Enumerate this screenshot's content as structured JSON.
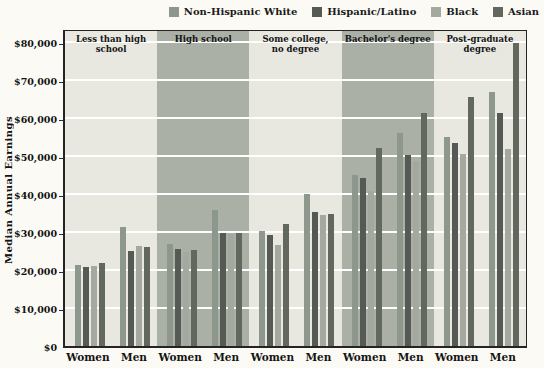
{
  "legend": [
    {
      "label": "Non-Hispanic White",
      "color": "#8e978b",
      "hatched": false
    },
    {
      "label": "Hispanic/Latino",
      "color": "#565a54",
      "hatched": true
    },
    {
      "label": "Black",
      "color": "#a4a89f",
      "hatched": false
    },
    {
      "label": "Asian",
      "color": "#63685f",
      "hatched": false
    }
  ],
  "y_axis": {
    "title": "Median Annual Earnings",
    "ticks": [
      "$0",
      "$10,000",
      "$20,000",
      "$30,000",
      "$40,000",
      "$50,000",
      "$60,000",
      "$70,000",
      "$80,000"
    ]
  },
  "colors": {
    "background": "#fbfaf5",
    "band_light": "#e8e8e1",
    "band_dark": "#aab0a5",
    "gridline": "#ffffff",
    "border": "#242424"
  },
  "chart_data": {
    "type": "bar",
    "title": "",
    "xlabel": "",
    "ylabel": "Median Annual Earnings",
    "ylim": [
      0,
      80000
    ],
    "ytick_step": 10000,
    "grid": true,
    "legend_position": "top-right",
    "series_names": [
      "Non-Hispanic White",
      "Hispanic/Latino",
      "Black",
      "Asian"
    ],
    "groups": [
      {
        "education": "Less than high school",
        "shaded": false,
        "genders": [
          {
            "label": "Women",
            "values": [
              21400,
              20900,
              21000,
              21900
            ]
          },
          {
            "label": "Men",
            "values": [
              31400,
              25000,
              26200,
              26000
            ]
          }
        ]
      },
      {
        "education": "High school",
        "shaded": true,
        "genders": [
          {
            "label": "Women",
            "values": [
              26900,
              25500,
              24700,
              25200
            ]
          },
          {
            "label": "Men",
            "values": [
              35700,
              29800,
              29400,
              29800
            ]
          }
        ]
      },
      {
        "education": "Some college,\nno degree",
        "shaded": false,
        "genders": [
          {
            "label": "Women",
            "values": [
              30300,
              29300,
              26700,
              32000
            ]
          },
          {
            "label": "Men",
            "values": [
              40000,
              35200,
              34500,
              34800
            ]
          }
        ]
      },
      {
        "education": "Bachelor's degree",
        "shaded": true,
        "genders": [
          {
            "label": "Women",
            "values": [
              45100,
              44300,
              40800,
              52200
            ]
          },
          {
            "label": "Men",
            "values": [
              56000,
              50200,
              48800,
              61300
            ]
          }
        ]
      },
      {
        "education": "Post-graduate degree",
        "shaded": false,
        "genders": [
          {
            "label": "Women",
            "values": [
              55100,
              53300,
              50400,
              65500
            ]
          },
          {
            "label": "Men",
            "values": [
              66900,
              61300,
              51800,
              79700
            ]
          }
        ]
      }
    ]
  }
}
